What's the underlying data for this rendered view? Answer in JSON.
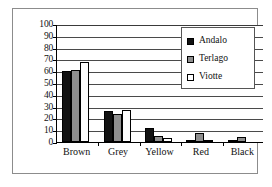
{
  "chart_data": {
    "type": "bar",
    "title": "",
    "subtitle": "",
    "xlabel": "",
    "ylabel": "",
    "categories": [
      "Brown",
      "Grey",
      "Yellow",
      "Red",
      "Black"
    ],
    "series": [
      {
        "name": "Andalo",
        "color": "#121212",
        "values": [
          60,
          26,
          12,
          2,
          1
        ]
      },
      {
        "name": "Terlago",
        "color": "#8e8e8e",
        "values": [
          61,
          24,
          5,
          7.5,
          4
        ]
      },
      {
        "name": "Viotte",
        "color": "#ffffff",
        "values": [
          68,
          27,
          3.5,
          2,
          0
        ]
      }
    ],
    "ylim": [
      0,
      100
    ],
    "ytick_step": 10,
    "yticks": [
      100,
      90,
      80,
      70,
      60,
      50,
      40,
      30,
      20,
      10,
      0
    ],
    "ytick_labels": [
      "100",
      "90",
      "80",
      "70",
      "60",
      "50",
      "40",
      "30",
      "20",
      "10",
      "0"
    ],
    "grid": true,
    "grid_axis": "y",
    "legend_position": "top-right",
    "legend_entries": [
      "Andalo",
      "Terlago",
      "Viotte"
    ]
  }
}
